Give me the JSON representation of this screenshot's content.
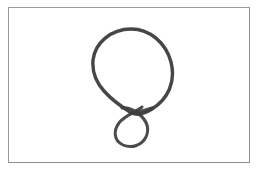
{
  "artwork": {
    "title": "balloon-sketch",
    "subject_label": "balloon",
    "medium": "pencil line drawing",
    "caption": "",
    "alt_text": "A hand-drawn balloon outline with a small knotted loop at the bottom"
  },
  "canvas": {
    "width": 260,
    "height": 172,
    "background_color": "#ffffff",
    "outside_frame_color": "#ffffff"
  },
  "frame": {
    "present": true,
    "x": 8,
    "y": 7,
    "width": 242,
    "height": 156,
    "border_width": 1,
    "border_color": "#9b9b9e",
    "border_color_shadow": "#8e8e92",
    "fill_color": "#ffffff"
  },
  "stroke": {
    "color": "#3c3c3e",
    "color_light": "#6a6a6d",
    "width_body": 3.4,
    "width_tail": 3.0,
    "opacity": 0.95
  },
  "shapes": [
    {
      "name": "balloon-body",
      "type": "closed-curve",
      "description": "large rounded teardrop loop forming the balloon envelope",
      "bounds": {
        "x": 92,
        "y": 28,
        "width": 80,
        "height": 86
      },
      "path": "M 131 29 C 150 29 166 43 171 62 C 176 82 168 99 152 109 C 144 114 136 116 130 112 C 122 107 112 100 104 91 C 96 82 92 71 93 60 C 95 43 111 29 131 29 Z"
    },
    {
      "name": "balloon-knot-loop",
      "type": "open-curve",
      "description": "small circular knot loop crossing under the balloon base",
      "bounds": {
        "x": 113,
        "y": 107,
        "width": 36,
        "height": 40
      },
      "path": "M 142 107 C 134 113 124 116 119 123 C 113 131 114 141 123 145 C 132 149 142 145 146 137 C 150 128 146 120 139 114 C 133 109 127 107 122 108"
    },
    {
      "name": "balloon-tail-right",
      "type": "open-curve",
      "description": "right side of balloon base descending into the crossing point",
      "bounds": {
        "x": 128,
        "y": 105,
        "width": 25,
        "height": 10
      },
      "path": "M 152 108 C 146 110 139 112 133 112"
    }
  ],
  "palette": {
    "ink": "#3c3c3e",
    "paper": "#ffffff",
    "frame": "#9b9b9e"
  }
}
